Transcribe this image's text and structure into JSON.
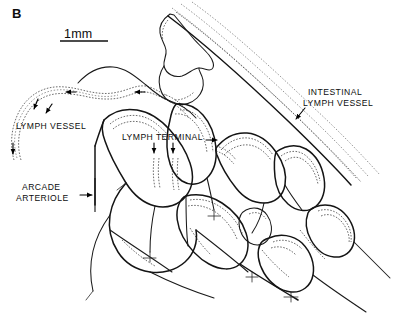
{
  "figure": {
    "panel_label": "B",
    "background_color": "#ffffff",
    "ink_color": "#141414",
    "width": 395,
    "height": 316
  },
  "scale_bar": {
    "label": "1mm",
    "x": 62,
    "y": 38,
    "rule_x1": 60,
    "rule_x2": 108,
    "rule_y": 41
  },
  "annotations": [
    {
      "id": "lymph-vessel",
      "label": "LYMPH VESSEL",
      "text_x": 16,
      "text_y": 129,
      "anchor": "start",
      "pointer": "arrow-down-left",
      "target_x": 46,
      "target_y": 112
    },
    {
      "id": "lymph-terminal",
      "label": "LYMPH TERMINAL",
      "text_x": 122,
      "text_y": 140,
      "anchor": "start",
      "pointer": "arrows-down",
      "target_x": 157,
      "target_y": 155
    },
    {
      "id": "arcade-arteriole",
      "label_line1": "ARCADE",
      "label_line2": "ARTERIOLE",
      "text_x": 22,
      "text_y": 190,
      "anchor": "start",
      "pointer": "arrow-right",
      "target_x": 93,
      "target_y": 195
    },
    {
      "id": "intestinal-lymph-vessel",
      "label_line1": "INTESTINAL",
      "label_line2": "LYMPH VESSEL",
      "text_x": 303,
      "text_y": 95,
      "anchor": "start",
      "pointer": "arrow-down-left",
      "target_x": 296,
      "target_y": 118
    }
  ],
  "flow_arrows": [
    {
      "id": "flow-1",
      "x": 68,
      "y": 92,
      "direction": "left"
    },
    {
      "id": "flow-2",
      "x": 35,
      "y": 108,
      "direction": "down"
    },
    {
      "id": "flow-3",
      "x": 13,
      "y": 152,
      "direction": "down"
    },
    {
      "id": "flow-4",
      "x": 137,
      "y": 92,
      "direction": "left"
    },
    {
      "id": "flow-5",
      "x": 154,
      "y": 150,
      "direction": "down"
    },
    {
      "id": "flow-6",
      "x": 173,
      "y": 150,
      "direction": "down"
    },
    {
      "id": "flow-7",
      "x": 216,
      "y": 140,
      "direction": "right"
    }
  ],
  "legend_notes": {
    "solid_lines": "arcade arteriole / venule network",
    "dashed_lines": "lymphatic vessels and terminals"
  }
}
